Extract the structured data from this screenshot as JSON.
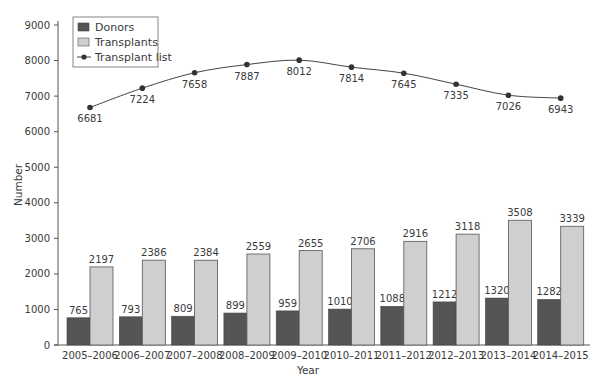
{
  "chart_data": {
    "type": "bar+line",
    "title": "",
    "xlabel": "Year",
    "ylabel": "Number",
    "ylim": [
      0,
      9000
    ],
    "yticks": [
      0,
      1000,
      2000,
      3000,
      4000,
      5000,
      6000,
      7000,
      8000,
      9000
    ],
    "grid": false,
    "legend_position": "top-left",
    "categories": [
      "2005–2006",
      "2006–2007",
      "2007–2008",
      "2008–2009",
      "2009–2010",
      "2010–2011",
      "2011–2012",
      "2012–2013",
      "2013–2014",
      "2014–2015"
    ],
    "series": [
      {
        "name": "Donors",
        "type": "bar",
        "color": "#555555",
        "values": [
          765,
          793,
          809,
          899,
          959,
          1010,
          1088,
          1212,
          1320,
          1282
        ]
      },
      {
        "name": "Transplants",
        "type": "bar",
        "color": "#cfcfcf",
        "values": [
          2197,
          2386,
          2384,
          2559,
          2655,
          2706,
          2916,
          3118,
          3508,
          3339
        ]
      },
      {
        "name": "Transplant list",
        "type": "line",
        "color": "#444444",
        "values": [
          6681,
          7224,
          7658,
          7887,
          8012,
          7814,
          7645,
          7335,
          7026,
          6943
        ]
      }
    ]
  },
  "legend": {
    "items": [
      {
        "label": "Donors",
        "swatch": "bar",
        "color": "#555555"
      },
      {
        "label": "Transplants",
        "swatch": "bar",
        "color": "#cfcfcf"
      },
      {
        "label": "Transplant list",
        "swatch": "line",
        "color": "#444444"
      }
    ]
  },
  "axes": {
    "x_title": "Year",
    "y_title": "Number"
  }
}
